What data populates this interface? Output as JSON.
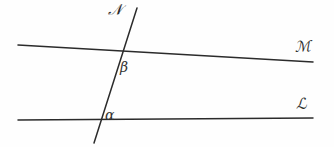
{
  "figure": {
    "kind": "geometry-diagram",
    "background_color": "#fefefe",
    "stroke_color": "#2b2b2b",
    "stroke_width": 1.4
  },
  "lines": [
    {
      "id": "line-M",
      "label": "ℳ",
      "role": "upper-parallel-line",
      "x1": 18,
      "y1": 45,
      "x2": 313,
      "y2": 62
    },
    {
      "id": "line-L",
      "label": "ℒ",
      "role": "lower-parallel-line",
      "x1": 18,
      "y1": 120,
      "x2": 313,
      "y2": 118
    },
    {
      "id": "line-N",
      "label": "𝒩",
      "role": "transversal-line",
      "x1": 137,
      "y1": 8,
      "x2": 94,
      "y2": 143
    }
  ],
  "angles": [
    {
      "id": "angle-beta",
      "label": "β",
      "at": "intersection of transversal and upper line",
      "x": 120,
      "y": 60
    },
    {
      "id": "angle-alpha",
      "label": "α",
      "at": "intersection of transversal and lower line",
      "x": 105,
      "y": 108
    }
  ],
  "labels": {
    "line_n": "𝒩",
    "line_m": "ℳ",
    "line_l": "ℒ",
    "angle_beta": "β",
    "angle_alpha": "α"
  },
  "intersections": [
    {
      "id": "intersection-upper",
      "x": 120,
      "y": 52
    },
    {
      "id": "intersection-lower",
      "x": 101,
      "y": 119
    }
  ]
}
